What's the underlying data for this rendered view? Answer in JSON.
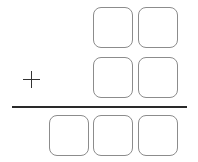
{
  "problem": {
    "type": "vertical-addition",
    "operator": "+",
    "addend1": {
      "digits": [
        "",
        ""
      ]
    },
    "addend2": {
      "digits": [
        "",
        ""
      ]
    },
    "sum": {
      "digits": [
        "",
        "",
        ""
      ]
    }
  },
  "colors": {
    "box_border": "#8c8c8c",
    "line": "#2a2a2a",
    "operator": "#333333"
  }
}
